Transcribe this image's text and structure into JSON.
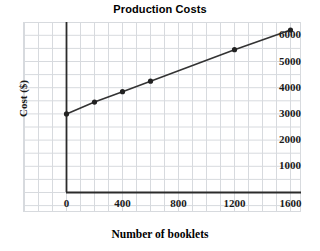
{
  "chart_data": {
    "type": "line",
    "title": "Production Costs",
    "xlabel": "Number of booklets",
    "ylabel": "Cost ($)",
    "x": [
      0,
      200,
      400,
      600,
      1200,
      1600
    ],
    "values": [
      3000,
      3450,
      3850,
      4250,
      5450,
      6200
    ],
    "series": [
      {
        "name": "Production Costs",
        "x": [
          0,
          200,
          400,
          600,
          1200,
          1600
        ],
        "values": [
          3000,
          3450,
          3850,
          4250,
          5450,
          6200
        ]
      }
    ],
    "xlim": [
      0,
      1800
    ],
    "ylim": [
      0,
      6600
    ],
    "xticks": [
      0,
      400,
      800,
      1200,
      1600
    ],
    "xtick_labels": [
      "0",
      "400",
      "800",
      "1200",
      "1600"
    ],
    "yticks": [
      1000,
      2000,
      3000,
      4000,
      5000,
      6000
    ],
    "ytick_labels": [
      "1000",
      "2000",
      "3000",
      "4000",
      "5000",
      "6000"
    ],
    "grid": true,
    "grid_color": "#d7dade",
    "line_color": "#333333",
    "marker_color": "#222222",
    "marker": "circle",
    "legend": "none",
    "background": "#ffffff"
  },
  "axes": {
    "axis_color": "#2b2b2b"
  }
}
